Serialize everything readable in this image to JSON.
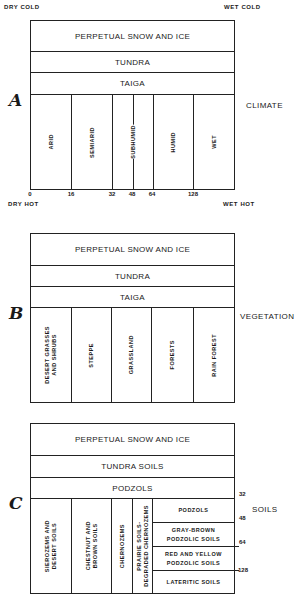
{
  "corners": {
    "top_left": "DRY COLD",
    "top_right": "WET COLD",
    "bottom_left": "DRY HOT",
    "bottom_right": "WET HOT"
  },
  "panels": [
    {
      "letter": "A",
      "side_label": "CLIMATE",
      "bands": [
        "PERPETUAL SNOW AND ICE",
        "TUNDRA",
        "TAIGA"
      ],
      "columns": [
        "ARID",
        "SEMIARID",
        "SUBHUMID",
        "HUMID",
        "WET"
      ],
      "axis_ticks": [
        "0",
        "16",
        "32",
        "48",
        "64",
        "128"
      ]
    },
    {
      "letter": "B",
      "side_label": "VEGETATION",
      "bands": [
        "PERPETUAL SNOW AND ICE",
        "TUNDRA",
        "TAIGA"
      ],
      "columns": [
        "DESERT GRASSES\nAND SHRUBS",
        "STEPPE",
        "GRASSLAND",
        "FORESTS",
        "RAIN FOREST"
      ]
    },
    {
      "letter": "C",
      "side_label": "SOILS",
      "bands": [
        "PERPETUAL SNOW AND ICE",
        "TUNDRA SOILS",
        "PODZOLS"
      ],
      "columns": [
        "SIEROZEMS AND\nDESERT SOILS",
        "CHESTNUT AND\nBROWN SOILS",
        "CHERNOZEMS",
        "PRAIRIE SOILS-\nDEGRADED CHERNOZEMS"
      ],
      "right_stack": [
        "PODZOLS",
        "GRAY-BROWN\nPODZOLIC SOILS",
        "RED AND YELLOW\nPODZOLIC SOILS",
        "LATERITIC SOILS"
      ],
      "right_ticks": [
        "32",
        "48",
        "64",
        "128"
      ]
    }
  ]
}
